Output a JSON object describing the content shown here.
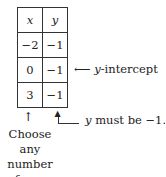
{
  "table": {
    "headers": [
      "x",
      "y"
    ],
    "rows": [
      {
        "x": "−2",
        "y": "−1"
      },
      {
        "x": "0",
        "y": "−1"
      },
      {
        "x": "3",
        "y": "−1"
      }
    ]
  },
  "annotations": {
    "row_arrow": "⟵",
    "y_intercept_var": "y",
    "y_intercept_label": "-intercept",
    "y_must_var": "y",
    "y_must_label": " must be −1.",
    "choose_line1": "Choose",
    "choose_line2": "any number",
    "choose_line3_prefix": "for ",
    "choose_line3_var": "x",
    "choose_line3_suffix": ".",
    "up_arrow": "↑"
  }
}
